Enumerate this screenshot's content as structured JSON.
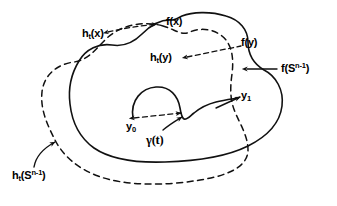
{
  "figure": {
    "background_color": "#ffffff",
    "ink_color": "#111111",
    "width": 337,
    "height": 206
  },
  "labels": {
    "h_t_x": {
      "base": "h",
      "sub": "t",
      "arg": "(x)",
      "full": "h_t(x)"
    },
    "f_x": {
      "full": "f(x)"
    },
    "f_y": {
      "full": "f(y)"
    },
    "h_t_y": {
      "base": "h",
      "sub": "t",
      "arg": "(y)",
      "full": "h_t(y)"
    },
    "f_sphere": {
      "base": "f(S",
      "sup": "n-1",
      "tail": ")",
      "full": "f(S^{n-1})"
    },
    "h_t_sphere": {
      "base": "h",
      "sub": "t",
      "mid": "(S",
      "sup": "n-1",
      "tail": ")",
      "full": "h_t(S^{n-1})"
    },
    "y_0": {
      "base": "y",
      "sub": "0",
      "full": "y_0"
    },
    "y_1": {
      "base": "y",
      "sub": "1",
      "full": "y_1"
    },
    "gamma_t": {
      "full": "γ(t)"
    }
  },
  "curves": {
    "f_sphere_curve": {
      "name": "f(S^{n-1})",
      "style": "solid",
      "description": "outer solid closed blob"
    },
    "h_t_sphere_curve": {
      "name": "h_t(S^{n-1})",
      "style": "dashed",
      "description": "outer dashed closed blob overlapping the solid blob"
    },
    "gamma_curve": {
      "name": "gamma(t)",
      "style": "solid",
      "description": "inner arc from y_0 over a hump, down to a cusp, then out to y_1"
    }
  },
  "leaders": [
    {
      "name": "h_t(x) leader",
      "style": "dashed",
      "arrowheads": "both"
    },
    {
      "name": "h_t(y) leader",
      "style": "dashed",
      "arrowheads": "start"
    },
    {
      "name": "f(S^{n-1}) leader",
      "style": "solid",
      "arrowheads": "start"
    },
    {
      "name": "h_t(S^{n-1}) leader",
      "style": "solid-curved",
      "arrowheads": "end"
    },
    {
      "name": "gamma(t) leader",
      "style": "solid",
      "arrowheads": "end"
    },
    {
      "name": "y_0 leader",
      "style": "dashed",
      "arrowheads": "both"
    },
    {
      "name": "y_1 leader",
      "style": "solid",
      "arrowheads": "end"
    }
  ]
}
